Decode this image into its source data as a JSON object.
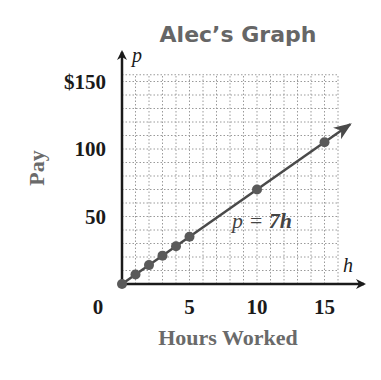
{
  "chart_data": {
    "type": "line",
    "title": "Alec’s Graph",
    "xlabel": "Hours Worked",
    "ylabel": "Pay",
    "x_var": "h",
    "y_var": "p",
    "equation": "p = 7h",
    "equation_parts": {
      "lhs": "p",
      "eq": " = ",
      "coef": "7",
      "var": "h"
    },
    "xlim": [
      0,
      16
    ],
    "ylim": [
      0,
      155
    ],
    "x_ticks": [
      {
        "value": 0,
        "label": "0"
      },
      {
        "value": 5,
        "label": "5"
      },
      {
        "value": 10,
        "label": "10"
      },
      {
        "value": 15,
        "label": "15"
      }
    ],
    "y_ticks": [
      {
        "value": 50,
        "label": "50"
      },
      {
        "value": 100,
        "label": "100"
      },
      {
        "value": 150,
        "label": "$150"
      }
    ],
    "grid": {
      "on": true,
      "x_step": 1,
      "y_step": 10,
      "style": "dotted"
    },
    "series": [
      {
        "name": "p = 7h",
        "points": [
          {
            "x": 0,
            "y": 0
          },
          {
            "x": 1,
            "y": 7
          },
          {
            "x": 2,
            "y": 14
          },
          {
            "x": 3,
            "y": 21
          },
          {
            "x": 4,
            "y": 28
          },
          {
            "x": 5,
            "y": 35
          },
          {
            "x": 10,
            "y": 70
          },
          {
            "x": 15,
            "y": 105
          }
        ],
        "line_extends_to_x": 16.9,
        "arrow": true
      }
    ],
    "colors": {
      "line": "#4a4a4a",
      "points": "#5a5a5a",
      "grid": "#9a9a9a",
      "axis": "#1a1a1a",
      "title": "#666666"
    }
  }
}
